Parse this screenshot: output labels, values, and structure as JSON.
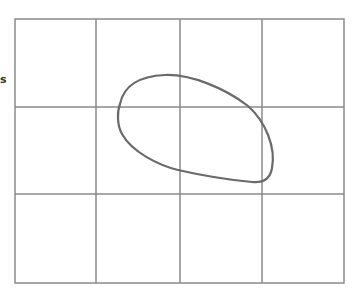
{
  "diagram": {
    "side_label": "s",
    "grid": {
      "columns": 4,
      "rows": 3,
      "line_color": "#8a8a8a"
    },
    "shape": {
      "type": "closed-loop",
      "stroke_color": "#6a6a6a"
    }
  }
}
